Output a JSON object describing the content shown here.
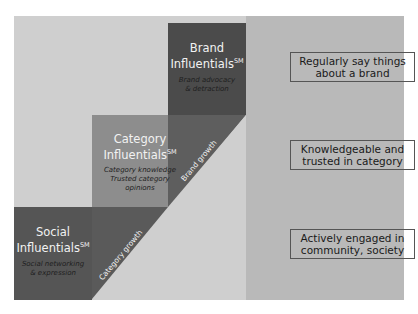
{
  "diagram": {
    "levels": [
      {
        "id": "social",
        "title": "Social Influentials",
        "superscript": "SM",
        "desc_line1": "Social networking",
        "desc_line2": "& expression",
        "color": "#555555"
      },
      {
        "id": "category",
        "title_line1": "Category",
        "title_line2": "Influentials",
        "superscript": "SM",
        "desc_line1": "Category knowledge",
        "desc_line2": "Trusted category",
        "desc_line3": "opinions",
        "color": "#8a8a8a"
      },
      {
        "id": "brand",
        "title_line1": "Brand",
        "title_line2": "Influentials",
        "superscript": "SM",
        "desc_line1": "Brand advocacy",
        "desc_line2": "& detraction",
        "color": "#4a4a4a"
      }
    ],
    "social_title_line1": "Social",
    "social_title_line2": "Influentials",
    "growth_labels": {
      "category": "Category growth",
      "brand": "Brand growth"
    },
    "descriptions": [
      {
        "line1": "Regularly say things",
        "line2": "about a brand"
      },
      {
        "line1": "Knowledgeable and",
        "line2": "trusted in category"
      },
      {
        "line1": "Actively engaged in",
        "line2": "community, society"
      }
    ]
  }
}
